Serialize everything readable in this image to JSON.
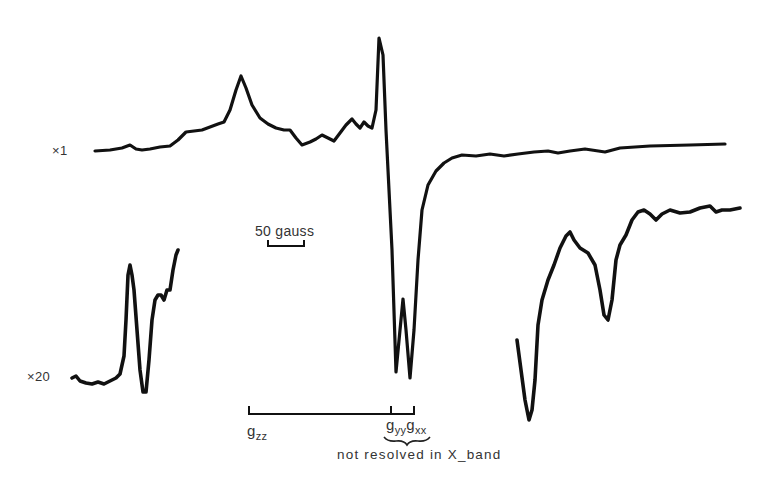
{
  "chart_data": {
    "type": "line",
    "title": "",
    "xlabel": "Magnetic field",
    "ylabel": "EPR signal (derivative)",
    "grid": false,
    "legend": null,
    "annotations": {
      "gain_x1": "×1",
      "gain_x20": "×20",
      "scale_bar": "50 gauss",
      "g_labels": [
        "g",
        "zz",
        "g",
        "yy",
        "g",
        "xx"
      ],
      "g_zz": "gzz",
      "g_yy": "gyy",
      "g_xx": "gxx",
      "brace_note": "not resolved in X_band"
    },
    "series": [
      {
        "name": "×1",
        "points": [
          [
            95,
            151
          ],
          [
            110,
            150
          ],
          [
            122,
            148
          ],
          [
            130,
            145
          ],
          [
            136,
            149
          ],
          [
            142,
            150
          ],
          [
            150,
            149
          ],
          [
            160,
            147
          ],
          [
            170,
            146
          ],
          [
            178,
            140
          ],
          [
            186,
            132
          ],
          [
            194,
            131
          ],
          [
            202,
            130
          ],
          [
            210,
            127
          ],
          [
            218,
            124
          ],
          [
            224,
            122
          ],
          [
            230,
            110
          ],
          [
            236,
            90
          ],
          [
            241,
            76
          ],
          [
            246,
            88
          ],
          [
            252,
            105
          ],
          [
            260,
            118
          ],
          [
            268,
            124
          ],
          [
            276,
            128
          ],
          [
            284,
            130
          ],
          [
            290,
            130
          ],
          [
            296,
            138
          ],
          [
            302,
            145
          ],
          [
            310,
            142
          ],
          [
            316,
            139
          ],
          [
            322,
            135
          ],
          [
            328,
            138
          ],
          [
            334,
            141
          ],
          [
            340,
            133
          ],
          [
            346,
            125
          ],
          [
            352,
            119
          ],
          [
            356,
            124
          ],
          [
            360,
            128
          ],
          [
            364,
            122
          ],
          [
            368,
            126
          ],
          [
            372,
            128
          ],
          [
            376,
            110
          ],
          [
            379,
            38
          ],
          [
            383,
            55
          ],
          [
            386,
            130
          ],
          [
            392,
            250
          ],
          [
            396,
            372
          ],
          [
            400,
            330
          ],
          [
            403,
            299
          ],
          [
            406,
            330
          ],
          [
            410,
            378
          ],
          [
            414,
            330
          ],
          [
            418,
            260
          ],
          [
            422,
            210
          ],
          [
            428,
            185
          ],
          [
            436,
            171
          ],
          [
            444,
            163
          ],
          [
            452,
            158
          ],
          [
            462,
            155
          ],
          [
            476,
            156
          ],
          [
            490,
            154
          ],
          [
            504,
            156
          ],
          [
            518,
            154
          ],
          [
            534,
            152
          ],
          [
            548,
            151
          ],
          [
            558,
            153
          ],
          [
            570,
            151
          ],
          [
            585,
            149
          ],
          [
            605,
            152
          ],
          [
            620,
            148
          ],
          [
            650,
            146
          ],
          [
            690,
            145
          ],
          [
            725,
            144
          ]
        ]
      },
      {
        "name": "×20 (low field)",
        "points": [
          [
            72,
            378
          ],
          [
            76,
            376
          ],
          [
            80,
            381
          ],
          [
            86,
            383
          ],
          [
            92,
            384
          ],
          [
            98,
            382
          ],
          [
            104,
            384
          ],
          [
            110,
            381
          ],
          [
            116,
            378
          ],
          [
            120,
            374
          ],
          [
            124,
            356
          ],
          [
            126,
            320
          ],
          [
            128,
            275
          ],
          [
            130,
            265
          ],
          [
            132,
            275
          ],
          [
            134,
            290
          ],
          [
            137,
            330
          ],
          [
            140,
            370
          ],
          [
            143,
            392
          ],
          [
            146,
            392
          ],
          [
            149,
            360
          ],
          [
            152,
            320
          ],
          [
            155,
            300
          ],
          [
            158,
            295
          ],
          [
            161,
            295
          ],
          [
            164,
            300
          ],
          [
            167,
            290
          ],
          [
            170,
            290
          ],
          [
            173,
            270
          ],
          [
            176,
            255
          ],
          [
            178,
            250
          ]
        ]
      },
      {
        "name": "×20 (high field)",
        "points": [
          [
            517,
            340
          ],
          [
            521,
            370
          ],
          [
            525,
            400
          ],
          [
            529,
            420
          ],
          [
            532,
            410
          ],
          [
            535,
            380
          ],
          [
            538,
            325
          ],
          [
            542,
            300
          ],
          [
            548,
            280
          ],
          [
            554,
            265
          ],
          [
            560,
            248
          ],
          [
            566,
            236
          ],
          [
            570,
            232
          ],
          [
            574,
            240
          ],
          [
            580,
            248
          ],
          [
            588,
            253
          ],
          [
            595,
            265
          ],
          [
            600,
            290
          ],
          [
            604,
            315
          ],
          [
            608,
            320
          ],
          [
            612,
            300
          ],
          [
            616,
            260
          ],
          [
            620,
            245
          ],
          [
            626,
            235
          ],
          [
            632,
            220
          ],
          [
            638,
            212
          ],
          [
            644,
            210
          ],
          [
            650,
            214
          ],
          [
            656,
            220
          ],
          [
            662,
            214
          ],
          [
            670,
            210
          ],
          [
            680,
            213
          ],
          [
            690,
            212
          ],
          [
            700,
            208
          ],
          [
            710,
            206
          ],
          [
            716,
            212
          ],
          [
            722,
            210
          ],
          [
            730,
            210
          ],
          [
            740,
            208
          ]
        ]
      }
    ],
    "scale_bar": {
      "label": "50 gauss",
      "x_start": 268,
      "x_end": 304,
      "width_px": 36
    },
    "g_bracket": {
      "g_zz_x": 249,
      "g_yy_x": 391,
      "g_xx_x": 414
    }
  }
}
